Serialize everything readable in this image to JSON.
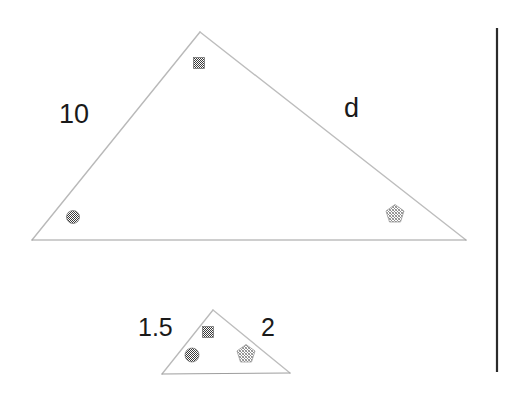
{
  "figure": {
    "background_color": "#ffffff",
    "stroke_color": "#b4b4b4",
    "baseline_color": "#a0a0a0",
    "divider_color": "#2b2b2b",
    "marker_dark_color": "#4a4a4a",
    "marker_light_color": "#9a9a9a",
    "labels": {
      "large_left_side": "10",
      "large_right_side": "d",
      "small_left_side": "1.5",
      "small_right_side": "2"
    },
    "large_triangle": {
      "name": "large-triangle",
      "apex": [
        200,
        32
      ],
      "bottom_left": [
        32,
        240
      ],
      "bottom_right": [
        466,
        240
      ],
      "markers": [
        {
          "name": "apex-square-marker",
          "shape": "square",
          "x": 199,
          "y": 63,
          "size": 11,
          "tone": "dark"
        },
        {
          "name": "bottom-left-circle-marker",
          "shape": "circle",
          "x": 73,
          "y": 217,
          "size": 13,
          "tone": "dark"
        },
        {
          "name": "bottom-right-pentagon-marker",
          "shape": "pentagon",
          "x": 395,
          "y": 214,
          "size": 19,
          "tone": "light"
        }
      ]
    },
    "small_triangle": {
      "name": "small-triangle",
      "apex": [
        213,
        310
      ],
      "bottom_left": [
        162,
        374
      ],
      "bottom_right": [
        290,
        373
      ],
      "markers": [
        {
          "name": "apex-square-marker",
          "shape": "square",
          "x": 208,
          "y": 332,
          "size": 11,
          "tone": "dark"
        },
        {
          "name": "bottom-left-circle-marker",
          "shape": "circle",
          "x": 192,
          "y": 355,
          "size": 14,
          "tone": "dark"
        },
        {
          "name": "bottom-right-pentagon-marker",
          "shape": "pentagon",
          "x": 246,
          "y": 354,
          "size": 19,
          "tone": "light"
        }
      ]
    },
    "divider_line": {
      "name": "right-vertical-divider",
      "x": 497,
      "y_top": 28,
      "y_bottom": 372
    }
  }
}
